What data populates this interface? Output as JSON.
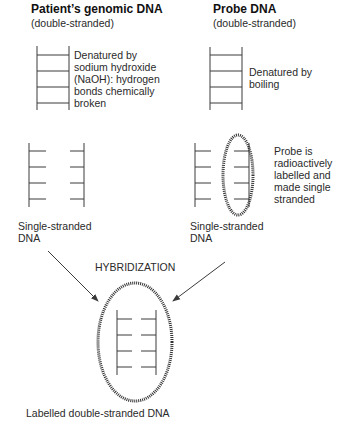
{
  "left_column": {
    "title": "Patient’s genomic DNA",
    "subtitle": "(double-stranded)",
    "denature_note": [
      "Denatured by",
      "sodium hydroxide",
      "(NaOH): hydrogen",
      "bonds chemically",
      "broken"
    ],
    "single_label": [
      "Single-stranded",
      "DNA"
    ]
  },
  "right_column": {
    "title": "Probe DNA",
    "subtitle": "(double-stranded)",
    "denature_note": [
      "Denatured by",
      "boiling"
    ],
    "probe_note": [
      "Probe is",
      "radioactively",
      "labelled and",
      "made single",
      "stranded"
    ],
    "single_label": [
      "Single-stranded",
      "DNA"
    ]
  },
  "hybridization": {
    "label": "HYBRIDIZATION",
    "result_label": "Labelled double-stranded DNA"
  },
  "colors": {
    "line": "#3a3a3a",
    "dotted_ellipse": "#333333",
    "text": "#2a2a2a"
  }
}
